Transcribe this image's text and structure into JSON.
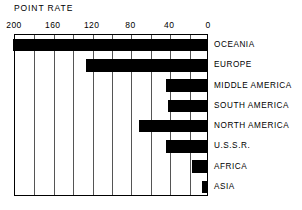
{
  "chart_data": {
    "type": "bar",
    "orientation": "horizontal",
    "title": "POINT RATE",
    "xlabel": "",
    "ylabel": "",
    "xlim": [
      200,
      0
    ],
    "x_axis_reversed": true,
    "grid": true,
    "grid_interval": 20,
    "legend": "none",
    "tick_labels": [
      "200",
      "160",
      "120",
      "80",
      "40",
      "0"
    ],
    "tick_values": [
      200,
      160,
      120,
      80,
      40,
      0
    ],
    "categories": [
      "OCEANIA",
      "EUROPE",
      "MIDDLE AMERICA",
      "SOUTH AMERICA",
      "NORTH AMERICA",
      "U.S.S.R.",
      "AFRICA",
      "ASIA"
    ],
    "values": [
      200,
      125,
      42,
      40,
      70,
      42,
      15,
      5
    ],
    "bar_color": "#000000",
    "background_color": "#ffffff"
  }
}
